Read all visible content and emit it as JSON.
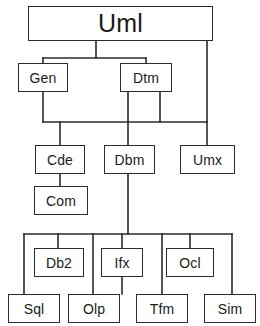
{
  "diagram": {
    "title": "Uml",
    "type": "package-hierarchy-tree",
    "background_color": "#ffffff",
    "line_color": "#2b2b2b",
    "text_color": "#1a1a1a",
    "canvas": {
      "width": 260,
      "height": 326
    },
    "nodes": [
      {
        "id": "uml",
        "label": "Uml",
        "x": 28,
        "y": 6,
        "w": 185,
        "h": 35,
        "level": 0,
        "size": "root"
      },
      {
        "id": "gen",
        "label": "Gen",
        "x": 18,
        "y": 63,
        "w": 50,
        "h": 29,
        "level": 1,
        "size": "std"
      },
      {
        "id": "dtm",
        "label": "Dtm",
        "x": 120,
        "y": 63,
        "w": 52,
        "h": 29,
        "level": 1,
        "size": "std"
      },
      {
        "id": "cde",
        "label": "Cde",
        "x": 35,
        "y": 145,
        "w": 50,
        "h": 29,
        "level": 2,
        "size": "std"
      },
      {
        "id": "dbm",
        "label": "Dbm",
        "x": 104,
        "y": 145,
        "w": 51,
        "h": 29,
        "level": 2,
        "size": "std"
      },
      {
        "id": "umx",
        "label": "Umx",
        "x": 180,
        "y": 145,
        "w": 55,
        "h": 29,
        "level": 2,
        "size": "std"
      },
      {
        "id": "com",
        "label": "Com",
        "x": 34,
        "y": 186,
        "w": 54,
        "h": 29,
        "level": 3,
        "size": "std"
      },
      {
        "id": "db2",
        "label": "Db2",
        "x": 34,
        "y": 248,
        "w": 50,
        "h": 29,
        "level": 4,
        "size": "std"
      },
      {
        "id": "ifx",
        "label": "Ifx",
        "x": 101,
        "y": 248,
        "w": 42,
        "h": 29,
        "level": 4,
        "size": "std"
      },
      {
        "id": "ocl",
        "label": "Ocl",
        "x": 166,
        "y": 248,
        "w": 48,
        "h": 29,
        "level": 4,
        "size": "std"
      },
      {
        "id": "sql",
        "label": "Sql",
        "x": 8,
        "y": 294,
        "w": 52,
        "h": 29,
        "level": 5,
        "size": "std"
      },
      {
        "id": "olp",
        "label": "Olp",
        "x": 68,
        "y": 294,
        "w": 52,
        "h": 29,
        "level": 5,
        "size": "std"
      },
      {
        "id": "tfm",
        "label": "Tfm",
        "x": 136,
        "y": 294,
        "w": 52,
        "h": 29,
        "level": 5,
        "size": "std"
      },
      {
        "id": "sim",
        "label": "Sim",
        "x": 204,
        "y": 294,
        "w": 52,
        "h": 29,
        "level": 5,
        "size": "std"
      }
    ],
    "edges": [
      {
        "from": "uml",
        "to": "gen"
      },
      {
        "from": "uml",
        "to": "dtm"
      },
      {
        "from": "uml",
        "to": "umx"
      },
      {
        "from": "gen",
        "to": "cde"
      },
      {
        "from": "dtm",
        "to": "dbm"
      },
      {
        "from": "dtm",
        "to": "umx"
      },
      {
        "from": "cde",
        "to": "com"
      },
      {
        "from": "dbm",
        "to": "db2"
      },
      {
        "from": "dbm",
        "to": "ifx"
      },
      {
        "from": "dbm",
        "to": "ocl"
      },
      {
        "from": "dbm",
        "to": "sql"
      },
      {
        "from": "dbm",
        "to": "olp"
      },
      {
        "from": "dbm",
        "to": "tfm"
      },
      {
        "from": "dbm",
        "to": "sim"
      }
    ],
    "connector_paths": [
      "M96,41 L96,58",
      "M43,58 L146,58",
      "M43,58 L43,63",
      "M146,58 L146,63",
      "M207,41 L207,145",
      "M43,92 L43,122",
      "M128,92 L128,122",
      "M160,92 L160,122",
      "M43,122 L207,122",
      "M60,122 L60,145",
      "M128,122 L128,145",
      "M60,174 L60,186",
      "M128,174 L128,234",
      "M24,234 L232,234",
      "M24,234 L24,294",
      "M58,234 L58,248",
      "M93,234 L93,294",
      "M122,234 L122,294",
      "M162,234 L162,294",
      "M190,234 L190,248",
      "M232,234 L232,294"
    ]
  }
}
